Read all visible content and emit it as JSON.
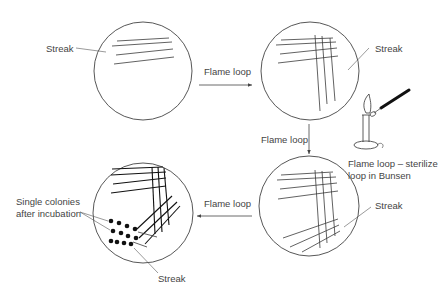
{
  "diagram": {
    "colors": {
      "stroke": "#444444",
      "text": "#444444",
      "colony": "#111111",
      "background": "#ffffff"
    },
    "dishes": [
      {
        "id": "dish-1",
        "step": 1,
        "label": "Streak"
      },
      {
        "id": "dish-2",
        "step": 2,
        "label": "Streak"
      },
      {
        "id": "dish-3",
        "step": 3,
        "label": "Streak"
      },
      {
        "id": "dish-4",
        "step": 4,
        "label": "Streak",
        "colonies_label_line1": "Single colonies",
        "colonies_label_line2": "after incubation"
      }
    ],
    "arrows": [
      {
        "from": "dish-1",
        "to": "dish-2",
        "label": "Flame loop"
      },
      {
        "from": "dish-2",
        "to": "dish-3",
        "label": "Flame loop"
      },
      {
        "from": "dish-3",
        "to": "dish-4",
        "label": "Flame loop"
      }
    ],
    "bunsen": {
      "caption_line1": "Flame loop – sterilize",
      "caption_line2": "loop in Bunsen"
    }
  }
}
